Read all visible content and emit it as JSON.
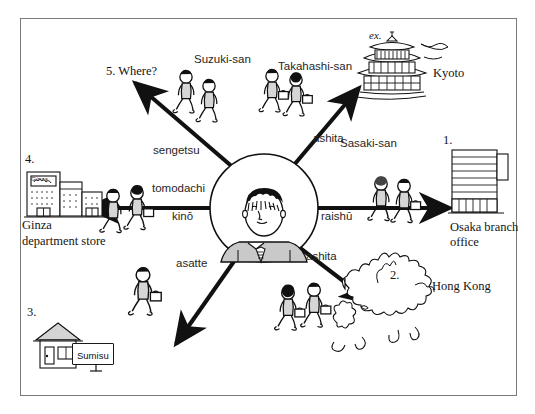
{
  "figure": {
    "frame": {
      "border_color": "#7a7a7a"
    }
  },
  "center": {
    "name": "central-speaker",
    "description": "businessman in suit with striped tie inside circle"
  },
  "branches": [
    {
      "id": "osaka",
      "number": "1.",
      "direction": "east",
      "time_word": "raishū",
      "person_label": "Sasaki-san",
      "destination": "Osaka branch office",
      "destination_lines": [
        "Osaka branch",
        "office"
      ],
      "icon": "office-building-icon"
    },
    {
      "id": "hongkong",
      "number": "2.",
      "direction": "southeast",
      "time_word": "ashita",
      "person_label": "",
      "destination": "Hong Kong",
      "destination_lines": [
        "Hong Kong"
      ],
      "icon": "hong-kong-map-icon"
    },
    {
      "id": "sumisu",
      "number": "3.",
      "direction": "southwest",
      "time_word": "asatte",
      "person_label": "",
      "destination": "Sumisu",
      "destination_lines": [
        "Sumisu"
      ],
      "icon": "house-icon"
    },
    {
      "id": "ginza",
      "number": "4.",
      "direction": "west",
      "time_word_upper": "tomodachi",
      "time_word": "kinō",
      "person_label": "",
      "destination": "Ginza department store",
      "destination_lines": [
        "Ginza",
        "department store"
      ],
      "icon": "department-store-icon"
    },
    {
      "id": "where",
      "number": "5.",
      "direction": "northwest",
      "time_word": "sengetsu",
      "person_label": "Suzuki-san",
      "destination": "5. Where?",
      "destination_lines": [
        "5. Where?"
      ],
      "icon": "none"
    },
    {
      "id": "kyoto",
      "number": "ex.",
      "direction": "northeast",
      "time_word": "ashita",
      "person_label": "Takahashi-san",
      "destination": "Kyoto",
      "destination_lines": [
        "Kyoto"
      ],
      "icon": "pagoda-icon"
    }
  ],
  "labels": {
    "where": "5. Where?",
    "suzuki": "Suzuki-san",
    "takahashi": "Takahashi-san",
    "ex": "ex.",
    "kyoto": "Kyoto",
    "sengetsu": "sengetsu",
    "ashita_ne": "ashita",
    "sasaki": "Sasaki-san",
    "num1": "1.",
    "osaka_line1": "Osaka branch",
    "osaka_line2": "office",
    "raishu": "raishū",
    "num4": "4.",
    "ginza_sign": "Ginza",
    "ginza_line1": "Ginza",
    "ginza_line2": "department store",
    "tomodachi": "tomodachi",
    "kino": "kinō",
    "asatte": "asatte",
    "ashita_se": "ashita",
    "num2": "2.",
    "hongkong": "Hong Kong",
    "num3": "3.",
    "sumisu": "Sumisu"
  }
}
